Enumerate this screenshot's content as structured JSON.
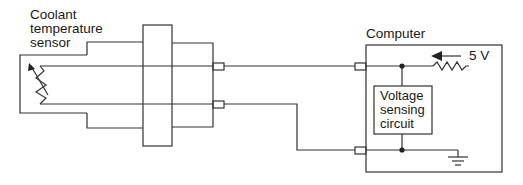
{
  "labels": {
    "sensor": "Coolant\ntemperature\nsensor",
    "computer": "Computer",
    "voltage": "5 V",
    "circuit": "Voltage\nsensing\ncircuit"
  },
  "colors": {
    "line": "#333333",
    "text": "#1a1a1a",
    "background": "#ffffff"
  }
}
